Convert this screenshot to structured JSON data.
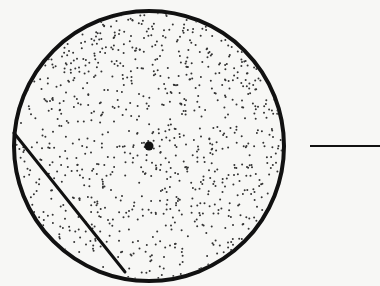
{
  "diagram": {
    "colors": {
      "background": "#f7f7f5",
      "stroke": "#111111",
      "stipple": "#333333"
    },
    "circle": {
      "cx": 149,
      "cy": 146,
      "r": 135,
      "stroke_width": 4
    },
    "center_point": {
      "cx": 149,
      "cy": 146,
      "r": 4.5
    },
    "chord": {
      "x1": 14,
      "y1": 133,
      "x2": 125,
      "y2": 272,
      "stroke_width": 3
    },
    "external_line": {
      "x1": 310,
      "y1": 146,
      "x2": 380,
      "y2": 146,
      "stroke_width": 2
    },
    "stipple": {
      "count": 900,
      "dot_radius": 1.0,
      "seed": 7
    }
  }
}
